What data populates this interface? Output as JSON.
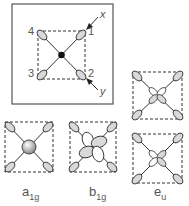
{
  "top_panel": {
    "axis_labels": {
      "x": "x",
      "y": "y"
    },
    "ligand_numbers": [
      "1",
      "2",
      "3",
      "4"
    ]
  },
  "symmetry_labels": {
    "a1g": {
      "main": "a",
      "sub": "1g"
    },
    "b1g": {
      "main": "b",
      "sub": "1g"
    },
    "eu": {
      "main": "e",
      "sub": "u"
    }
  },
  "colors": {
    "line": "#333333",
    "shade": "#d9d9d9",
    "frame": "#555555"
  }
}
